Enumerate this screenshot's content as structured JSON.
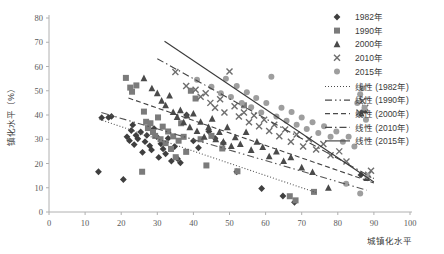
{
  "chart_data": {
    "type": "scatter",
    "title": "",
    "xlabel": "城镇化水平",
    "ylabel": "镇化水平（%）",
    "xlim": [
      0,
      100
    ],
    "ylim": [
      0,
      80
    ],
    "xticks": [
      0,
      10,
      20,
      30,
      40,
      50,
      60,
      70,
      80,
      90,
      100
    ],
    "yticks": [
      0,
      10,
      20,
      30,
      40,
      50,
      60,
      70,
      80
    ],
    "grid": false,
    "legend_position": "right",
    "colors": {
      "1982": "#3f3f3f",
      "1990": "#7b7b7b",
      "2000": "#4a4a4a",
      "2010": "#6e6e6e",
      "2015": "#9e9e9e",
      "axis": "#b0b0b0",
      "text": "#3a3a3a"
    },
    "series": [
      {
        "name": "1982年",
        "marker": "diamond",
        "color": "#3f3f3f",
        "points": [
          [
            13.7,
            16.6
          ],
          [
            14.6,
            38.9
          ],
          [
            16.5,
            39.0
          ],
          [
            17.3,
            39.4
          ],
          [
            20.6,
            13.4
          ],
          [
            21.6,
            31.0
          ],
          [
            22.3,
            29.4
          ],
          [
            22.8,
            33.6
          ],
          [
            23.2,
            35.9
          ],
          [
            23.6,
            27.8
          ],
          [
            24.1,
            31.6
          ],
          [
            24.6,
            30.2
          ],
          [
            25.4,
            33.0
          ],
          [
            25.9,
            24.6
          ],
          [
            26.6,
            29.0
          ],
          [
            27.1,
            31.6
          ],
          [
            27.9,
            27.3
          ],
          [
            28.4,
            25.6
          ],
          [
            29.1,
            34.4
          ],
          [
            29.8,
            31.1
          ],
          [
            30.4,
            22.5
          ],
          [
            31.0,
            28.1
          ],
          [
            31.6,
            26.0
          ],
          [
            32.3,
            24.0
          ],
          [
            33.0,
            30.4
          ],
          [
            33.9,
            21.0
          ],
          [
            34.8,
            27.0
          ],
          [
            35.6,
            22.0
          ],
          [
            36.4,
            20.3
          ],
          [
            38.1,
            40.0
          ],
          [
            40.0,
            29.3
          ],
          [
            41.4,
            26.5
          ],
          [
            44.3,
            33.2
          ],
          [
            46.0,
            30.4
          ],
          [
            48.3,
            28.5
          ],
          [
            52.0,
            16.6
          ],
          [
            58.9,
            9.7
          ],
          [
            64.8,
            6.6
          ],
          [
            68.0,
            4.0
          ],
          [
            86.4,
            15.3
          ]
        ]
      },
      {
        "name": "1990年",
        "marker": "square",
        "color": "#7b7b7b",
        "points": [
          [
            21.3,
            55.3
          ],
          [
            22.5,
            51.3
          ],
          [
            23.0,
            49.6
          ],
          [
            24.2,
            52.2
          ],
          [
            25.8,
            16.6
          ],
          [
            26.3,
            41.4
          ],
          [
            26.9,
            37.2
          ],
          [
            27.4,
            34.6
          ],
          [
            28.1,
            36.6
          ],
          [
            28.8,
            33.0
          ],
          [
            29.4,
            31.4
          ],
          [
            30.2,
            39.0
          ],
          [
            30.9,
            30.0
          ],
          [
            31.5,
            35.2
          ],
          [
            32.3,
            28.4
          ],
          [
            33.0,
            33.2
          ],
          [
            33.8,
            26.0
          ],
          [
            34.4,
            31.2
          ],
          [
            35.1,
            22.6
          ],
          [
            35.9,
            29.4
          ],
          [
            36.6,
            36.6
          ],
          [
            37.3,
            31.0
          ],
          [
            38.0,
            24.8
          ],
          [
            39.3,
            50.0
          ],
          [
            40.6,
            46.8
          ],
          [
            42.0,
            30.0
          ],
          [
            43.6,
            19.2
          ],
          [
            45.0,
            31.4
          ],
          [
            48.0,
            26.2
          ],
          [
            52.2,
            16.8
          ],
          [
            54.0,
            44.0
          ],
          [
            66.7,
            6.5
          ],
          [
            68.3,
            4.8
          ],
          [
            73.4,
            8.3
          ]
        ]
      },
      {
        "name": "2000年",
        "marker": "triangle",
        "color": "#4a4a4a",
        "points": [
          [
            26.3,
            55.2
          ],
          [
            28.5,
            51.0
          ],
          [
            30.0,
            49.0
          ],
          [
            31.2,
            45.9
          ],
          [
            32.3,
            44.0
          ],
          [
            33.4,
            48.0
          ],
          [
            34.4,
            41.2
          ],
          [
            35.5,
            39.2
          ],
          [
            36.4,
            42.0
          ],
          [
            37.3,
            37.0
          ],
          [
            38.2,
            39.8
          ],
          [
            39.0,
            35.0
          ],
          [
            40.0,
            40.6
          ],
          [
            41.0,
            33.4
          ],
          [
            42.0,
            37.2
          ],
          [
            43.0,
            31.0
          ],
          [
            44.2,
            35.0
          ],
          [
            45.2,
            38.5
          ],
          [
            46.2,
            30.0
          ],
          [
            47.2,
            33.0
          ],
          [
            48.3,
            29.0
          ],
          [
            49.4,
            35.0
          ],
          [
            50.5,
            27.2
          ],
          [
            51.6,
            30.8
          ],
          [
            53.0,
            28.0
          ],
          [
            54.6,
            33.0
          ],
          [
            56.0,
            25.6
          ],
          [
            57.6,
            29.0
          ],
          [
            59.2,
            26.8
          ],
          [
            61.0,
            23.0
          ],
          [
            63.0,
            25.0
          ],
          [
            65.0,
            21.0
          ],
          [
            67.0,
            22.6
          ],
          [
            70.0,
            18.4
          ],
          [
            73.0,
            16.5
          ],
          [
            77.4,
            10.0
          ],
          [
            86.5,
            40.6
          ],
          [
            87.4,
            42.0
          ],
          [
            88.0,
            14.0
          ]
        ]
      },
      {
        "name": "2010年",
        "marker": "x",
        "color": "#6e6e6e",
        "points": [
          [
            35.0,
            57.7
          ],
          [
            38.0,
            52.0
          ],
          [
            40.6,
            50.4
          ],
          [
            42.0,
            47.5
          ],
          [
            43.4,
            49.0
          ],
          [
            44.7,
            45.0
          ],
          [
            46.0,
            43.0
          ],
          [
            47.4,
            46.5
          ],
          [
            48.6,
            41.0
          ],
          [
            50.0,
            57.9
          ],
          [
            51.4,
            43.6
          ],
          [
            52.6,
            39.4
          ],
          [
            54.0,
            41.0
          ],
          [
            55.4,
            37.0
          ],
          [
            56.8,
            39.8
          ],
          [
            58.2,
            35.4
          ],
          [
            59.6,
            38.0
          ],
          [
            61.0,
            33.4
          ],
          [
            62.4,
            36.0
          ],
          [
            63.8,
            31.2
          ],
          [
            65.4,
            34.0
          ],
          [
            67.0,
            29.0
          ],
          [
            68.6,
            32.0
          ],
          [
            70.4,
            27.0
          ],
          [
            72.0,
            30.0
          ],
          [
            74.0,
            25.8
          ],
          [
            76.0,
            28.0
          ],
          [
            78.0,
            23.4
          ],
          [
            80.4,
            25.0
          ],
          [
            82.4,
            20.8
          ],
          [
            86.0,
            41.0
          ],
          [
            86.8,
            45.8
          ],
          [
            87.6,
            43.0
          ],
          [
            88.4,
            15.4
          ],
          [
            89.2,
            17.0
          ]
        ]
      },
      {
        "name": "2015年",
        "marker": "circle",
        "color": "#9e9e9e",
        "points": [
          [
            41.0,
            54.5
          ],
          [
            45.0,
            51.6
          ],
          [
            47.6,
            49.0
          ],
          [
            49.0,
            55.0
          ],
          [
            50.4,
            47.4
          ],
          [
            52.0,
            52.0
          ],
          [
            53.4,
            45.0
          ],
          [
            54.8,
            49.4
          ],
          [
            56.0,
            43.2
          ],
          [
            57.4,
            47.0
          ],
          [
            58.8,
            41.0
          ],
          [
            60.2,
            45.0
          ],
          [
            61.6,
            55.8
          ],
          [
            63.0,
            39.4
          ],
          [
            64.4,
            43.0
          ],
          [
            65.8,
            37.6
          ],
          [
            67.2,
            41.2
          ],
          [
            68.6,
            36.0
          ],
          [
            70.0,
            39.0
          ],
          [
            71.4,
            34.2
          ],
          [
            73.0,
            37.0
          ],
          [
            74.6,
            32.6
          ],
          [
            76.2,
            35.4
          ],
          [
            78.0,
            31.0
          ],
          [
            79.6,
            33.2
          ],
          [
            81.4,
            29.0
          ],
          [
            83.0,
            31.0
          ],
          [
            84.6,
            27.0
          ],
          [
            85.4,
            45.0
          ],
          [
            86.2,
            48.6
          ],
          [
            86.8,
            51.0
          ],
          [
            87.4,
            43.0
          ],
          [
            87.8,
            38.0
          ],
          [
            88.2,
            15.0
          ],
          [
            82.3,
            11.6
          ],
          [
            86.2,
            7.6
          ]
        ]
      }
    ],
    "trendlines": [
      {
        "name": "线性 (1982年)",
        "style": "dotted",
        "color": "#555555",
        "x0": 14.0,
        "y0": 38.2,
        "x1": 74.0,
        "y1": 8.0
      },
      {
        "name": "线性 (1990年)",
        "style": "dashdotdot",
        "color": "#555555",
        "x0": 14.5,
        "y0": 41.0,
        "x1": 88.0,
        "y1": 9.0
      },
      {
        "name": "线性 (2000年)",
        "style": "dashed",
        "color": "#444444",
        "x0": 22.0,
        "y0": 47.0,
        "x1": 90.0,
        "y1": 12.0
      },
      {
        "name": "线性 (2010年)",
        "style": "dashdot",
        "color": "#444444",
        "x0": 30.0,
        "y0": 63.2,
        "x1": 90.0,
        "y1": 13.8
      },
      {
        "name": "线性 (2015年)",
        "style": "solid",
        "color": "#3a3a3a",
        "x0": 32.0,
        "y0": 70.4,
        "x1": 90.0,
        "y1": 12.4
      }
    ]
  },
  "legend": {
    "markers": [
      {
        "label": "1982年",
        "marker": "diamond",
        "color": "#3f3f3f"
      },
      {
        "label": "1990年",
        "marker": "square",
        "color": "#7b7b7b"
      },
      {
        "label": "2000年",
        "marker": "triangle",
        "color": "#4a4a4a"
      },
      {
        "label": "2010年",
        "marker": "x",
        "color": "#6e6e6e"
      },
      {
        "label": "2015年",
        "marker": "circle",
        "color": "#9e9e9e"
      }
    ],
    "lines": [
      {
        "label": "线性 (1982年)",
        "style": "dotted"
      },
      {
        "label": "线性 (1990年)",
        "style": "dashdotdot"
      },
      {
        "label": "线性 (2000年)",
        "style": "dashed"
      },
      {
        "label": "线性 (2010年)",
        "style": "dashdot"
      },
      {
        "label": "线性 (2015年)",
        "style": "solid"
      }
    ]
  }
}
